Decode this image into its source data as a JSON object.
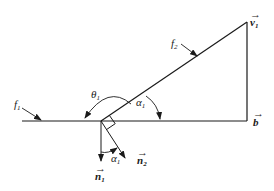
{
  "diagram": {
    "type": "vector-geometry",
    "line_color": "#1a1a1a",
    "labels": {
      "f1": {
        "main": "f",
        "sub": "1"
      },
      "f2": {
        "main": "f",
        "sub": "2"
      },
      "v1": {
        "main": "v",
        "sub": "1",
        "vector": true
      },
      "b": {
        "main": "b",
        "vector": true
      },
      "theta1": {
        "main": "θ",
        "sub": "1"
      },
      "alpha1_upper": {
        "main": "α",
        "sub": "1"
      },
      "alpha1_lower": {
        "main": "α",
        "sub": "1"
      },
      "n1": {
        "main": "n",
        "sub": "1",
        "vector": true
      },
      "n2": {
        "main": "n",
        "sub": "2",
        "vector": true
      }
    },
    "arrow_glyph": "→"
  }
}
